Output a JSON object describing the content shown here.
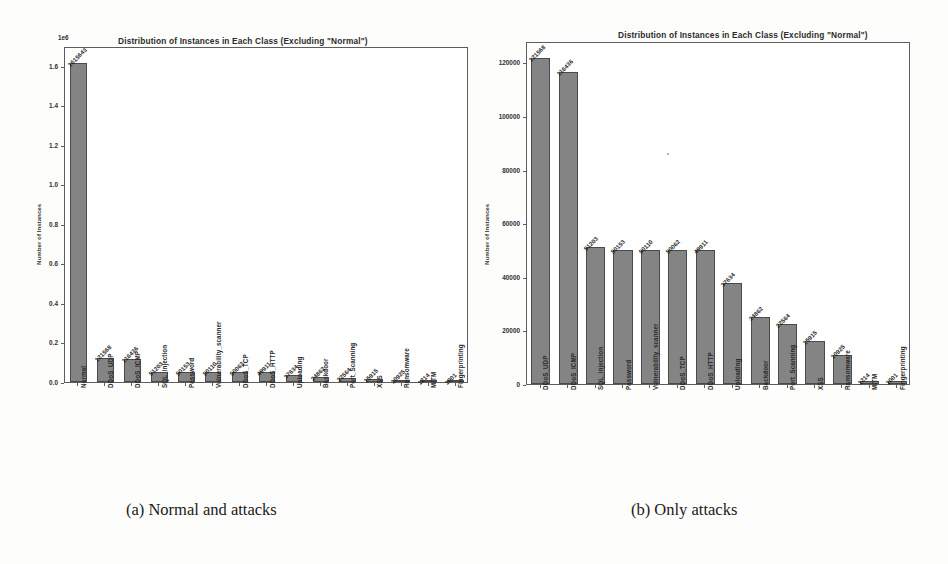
{
  "figure": {
    "caption_a": "(a) Normal and attacks",
    "caption_b": "(b) Only attacks"
  },
  "chart_data": [
    {
      "id": "panel-a",
      "type": "bar",
      "title": "Distribution of Instances in Each Class (Excluding \"Normal\")",
      "xlabel": "",
      "ylabel": "Number of Instances",
      "offset_text": "1e6",
      "ylim": [
        0,
        1700000
      ],
      "yticks": [
        0,
        200000,
        400000,
        600000,
        800000,
        1000000,
        1200000,
        1400000,
        1600000
      ],
      "ytick_labels": [
        "0.0",
        "0.2",
        "0.4",
        "0.6",
        "0.8",
        "1.0",
        "1.2",
        "1.4",
        "1.6"
      ],
      "grid": false,
      "legend": "none",
      "categories": [
        "Normal",
        "DDoS_UDP",
        "DDoS_ICMP",
        "SQL_injection",
        "Password",
        "Vulnerability_scanner",
        "DDoS_TCP",
        "DDoS_HTTP",
        "Uploading",
        "Backdoor",
        "Port_Scanning",
        "XSS",
        "Ransomware",
        "MITM",
        "Fingerprinting"
      ],
      "values": [
        1615643,
        121568,
        116436,
        51203,
        50153,
        50110,
        50062,
        49911,
        37634,
        24862,
        22564,
        15915,
        10925,
        1214,
        1001
      ],
      "data_labels": [
        "1615643",
        "121568",
        "116436",
        "51203",
        "50153",
        "50110",
        "50062",
        "49911",
        "37634",
        "24862",
        "22564",
        "15915",
        "10925",
        "1214",
        "1001"
      ]
    },
    {
      "id": "panel-b",
      "type": "bar",
      "title": "Distribution of Instances in Each Class (Excluding \"Normal\")",
      "xlabel": "",
      "ylabel": "Number of Instances",
      "offset_text": "",
      "ylim": [
        0,
        128000
      ],
      "yticks": [
        0,
        20000,
        40000,
        60000,
        80000,
        100000,
        120000
      ],
      "ytick_labels": [
        "0",
        "20000",
        "40000",
        "60000",
        "80000",
        "100000",
        "120000"
      ],
      "grid": false,
      "legend": "none",
      "categories": [
        "DDoS_UDP",
        "DDoS_ICMP",
        "SQL_injection",
        "Password",
        "Vulnerability_scanner",
        "DDoS_TCP",
        "DDoS_HTTP",
        "Uploading",
        "Backdoor",
        "Port_Scanning",
        "XSS",
        "Ransomware",
        "MITM",
        "Fingerprinting"
      ],
      "values": [
        121568,
        116436,
        51203,
        50153,
        50110,
        50062,
        49911,
        37634,
        24862,
        22564,
        15915,
        10925,
        1214,
        1001
      ],
      "data_labels": [
        "121568",
        "116436",
        "51203",
        "50153",
        "50110",
        "50062",
        "49911",
        "37634",
        "24862",
        "22564",
        "15915",
        "10925",
        "1214",
        "1001"
      ]
    }
  ]
}
